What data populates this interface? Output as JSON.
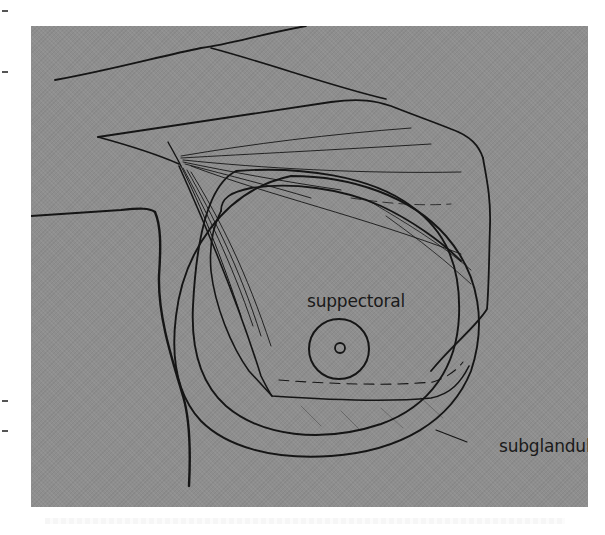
{
  "figure": {
    "type": "medical line illustration",
    "background_color": "#8e8e8e",
    "line_color": "#151515",
    "labels": {
      "suppectoral": "suppectoral",
      "subglandular": "subglandular"
    }
  },
  "margin_ticks": [
    10,
    71,
    400,
    430
  ]
}
